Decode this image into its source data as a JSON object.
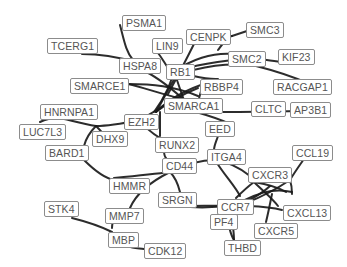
{
  "diagram": {
    "type": "protein-interaction-network",
    "background": "#ffffff",
    "edge_color": "#1a1a1a",
    "node_border_color": "#8c8c8c",
    "node_text_color": "#555555",
    "nodes": [
      {
        "id": "PSMA1",
        "label": "PSMA1",
        "x": 122,
        "y": 15
      },
      {
        "id": "TCERG1",
        "label": "TCERG1",
        "x": 47,
        "y": 38
      },
      {
        "id": "LIN9",
        "label": "LIN9",
        "x": 152,
        "y": 38
      },
      {
        "id": "CENPK",
        "label": "CENPK",
        "x": 186,
        "y": 29
      },
      {
        "id": "SMC3",
        "label": "SMC3",
        "x": 246,
        "y": 22
      },
      {
        "id": "HSPA8",
        "label": "HSPA8",
        "x": 119,
        "y": 58
      },
      {
        "id": "SMC2",
        "label": "SMC2",
        "x": 228,
        "y": 51
      },
      {
        "id": "KIF23",
        "label": "KIF23",
        "x": 278,
        "y": 49
      },
      {
        "id": "RB1",
        "label": "RB1",
        "x": 166,
        "y": 64
      },
      {
        "id": "SMARCE1",
        "label": "SMARCE1",
        "x": 70,
        "y": 78
      },
      {
        "id": "RBBP4",
        "label": "RBBP4",
        "x": 200,
        "y": 79
      },
      {
        "id": "RACGAP1",
        "label": "RACGAP1",
        "x": 273,
        "y": 79
      },
      {
        "id": "SMARCA1",
        "label": "SMARCA1",
        "x": 164,
        "y": 98
      },
      {
        "id": "HNRNPA1",
        "label": "HNRNPA1",
        "x": 40,
        "y": 104
      },
      {
        "id": "EZH2",
        "label": "EZH2",
        "x": 124,
        "y": 114
      },
      {
        "id": "CLTC",
        "label": "CLTC",
        "x": 251,
        "y": 101
      },
      {
        "id": "AP3B1",
        "label": "AP3B1",
        "x": 290,
        "y": 102
      },
      {
        "id": "LUC7L3",
        "label": "LUC7L3",
        "x": 19,
        "y": 124
      },
      {
        "id": "DHX9",
        "label": "DHX9",
        "x": 92,
        "y": 131
      },
      {
        "id": "EED",
        "label": "EED",
        "x": 205,
        "y": 121
      },
      {
        "id": "BARD1",
        "label": "BARD1",
        "x": 45,
        "y": 145
      },
      {
        "id": "RUNX2",
        "label": "RUNX2",
        "x": 155,
        "y": 137
      },
      {
        "id": "CD44",
        "label": "CD44",
        "x": 162,
        "y": 158
      },
      {
        "id": "ITGA4",
        "label": "ITGA4",
        "x": 207,
        "y": 149
      },
      {
        "id": "CCL19",
        "label": "CCL19",
        "x": 292,
        "y": 145
      },
      {
        "id": "CXCR3",
        "label": "CXCR3",
        "x": 248,
        "y": 167
      },
      {
        "id": "HMMR",
        "label": "HMMR",
        "x": 109,
        "y": 178
      },
      {
        "id": "SRGN",
        "label": "SRGN",
        "x": 158,
        "y": 192
      },
      {
        "id": "CCR7",
        "label": "CCR7",
        "x": 217,
        "y": 199
      },
      {
        "id": "CXCL13",
        "label": "CXCL13",
        "x": 283,
        "y": 205
      },
      {
        "id": "PF4",
        "label": "PF4",
        "x": 210,
        "y": 214
      },
      {
        "id": "CXCR5",
        "label": "CXCR5",
        "x": 254,
        "y": 223
      },
      {
        "id": "STK4",
        "label": "STK4",
        "x": 44,
        "y": 201
      },
      {
        "id": "MMP7",
        "label": "MMP7",
        "x": 105,
        "y": 208
      },
      {
        "id": "MBP",
        "label": "MBP",
        "x": 108,
        "y": 232
      },
      {
        "id": "THBD",
        "label": "THBD",
        "x": 224,
        "y": 240
      },
      {
        "id": "CDK12",
        "label": "CDK12",
        "x": 144,
        "y": 243
      }
    ],
    "edges": [
      {
        "d": "M 120 25 C 124 40, 126 52, 133 60"
      },
      {
        "d": "M 82 54 C 100 54, 118 57, 135 62"
      },
      {
        "d": "M 158 53 C 162 58, 164 62, 168 68"
      },
      {
        "d": "M 140 69 C 152 74, 164 82, 182 98"
      },
      {
        "d": "M 128 84 C 152 84, 174 86, 198 96"
      },
      {
        "d": "M 128 84 C 146 88, 166 96, 188 100"
      },
      {
        "d": "M 174 72 C 178 82, 180 90, 184 100"
      },
      {
        "d": "M 174 72 C 170 84, 166 96, 154 112"
      },
      {
        "d": "M 174 72 C 196 76, 206 80, 218 79"
      },
      {
        "d": "M 174 72 C 190 60, 212 52, 234 54"
      },
      {
        "d": "M 174 72 C 196 64, 230 60, 254 58 C 270 60, 282 64, 295 60"
      },
      {
        "d": "M 176 76 C 200 66, 230 62, 256 66 C 280 72, 296 78, 310 84"
      },
      {
        "d": "M 168 94 C 180 72, 188 56, 196 40"
      },
      {
        "d": "M 218 50 C 224 42, 228 36, 232 36"
      },
      {
        "d": "M 232 36 C 238 34, 244 32, 250 30"
      },
      {
        "d": "M 156 112 C 166 104, 178 96, 198 88"
      },
      {
        "d": "M 156 112 C 170 98, 190 88, 210 82"
      },
      {
        "d": "M 156 112 C 164 98, 170 86, 176 76"
      },
      {
        "d": "M 196 112 C 198 102, 200 94, 202 88"
      },
      {
        "d": "M 196 112 C 210 116, 222 120, 230 124"
      },
      {
        "d": "M 196 112 C 230 112, 290 112, 320 110"
      },
      {
        "d": "M 140 120 C 150 114, 164 106, 172 100"
      },
      {
        "d": "M 140 120 C 144 126, 150 132, 160 138"
      },
      {
        "d": "M 140 120 C 120 124, 104 126, 96 126"
      },
      {
        "d": "M 96 126 C 80 124, 64 118, 58 118 C 50 118, 44 120, 40 122"
      },
      {
        "d": "M 96 126 C 100 130, 104 134, 106 138"
      },
      {
        "d": "M 96 126 C 90 132, 86 138, 84 146"
      },
      {
        "d": "M 160 112 C 160 122, 160 130, 160 136"
      },
      {
        "d": "M 164 150 C 164 154, 164 156, 166 158"
      },
      {
        "d": "M 218 136 C 216 142, 214 146, 214 150"
      },
      {
        "d": "M 84 160 C 94 170, 104 178, 114 180"
      },
      {
        "d": "M 114 178 C 134 176, 154 174, 170 172"
      },
      {
        "d": "M 170 172 C 186 164, 200 160, 215 160"
      },
      {
        "d": "M 215 160 C 230 162, 240 168, 250 176"
      },
      {
        "d": "M 215 160 C 225 176, 235 186, 240 196"
      },
      {
        "d": "M 170 172 C 176 178, 178 184, 180 192"
      },
      {
        "d": "M 170 172 C 150 182, 136 194, 130 208"
      },
      {
        "d": "M 178 206 C 196 208, 214 208, 230 205"
      },
      {
        "d": "M 180 206 C 220 206, 260 204, 282 210"
      },
      {
        "d": "M 254 182 C 266 184, 276 186, 286 192"
      },
      {
        "d": "M 254 182 C 264 192, 272 198, 278 206"
      },
      {
        "d": "M 254 182 C 246 188, 240 194, 236 198"
      },
      {
        "d": "M 254 182 C 264 178, 278 176, 290 180"
      },
      {
        "d": "M 290 180 C 296 170, 302 162, 306 156"
      },
      {
        "d": "M 290 180 C 278 188, 264 196, 248 202"
      },
      {
        "d": "M 290 180 C 292 186, 292 190, 292 194"
      },
      {
        "d": "M 270 186 C 262 194, 250 200, 240 205"
      },
      {
        "d": "M 245 200 C 260 192, 276 188, 292 192"
      },
      {
        "d": "M 272 194 C 270 204, 268 214, 266 222"
      },
      {
        "d": "M 230 205 C 232 218, 234 232, 234 240"
      },
      {
        "d": "M 226 210 C 228 224, 230 234, 234 240"
      },
      {
        "d": "M 72 218 C 88 222, 100 226, 112 232"
      },
      {
        "d": "M 112 228 C 112 224, 114 218, 116 214"
      },
      {
        "d": "M 128 246 C 132 248, 136 248, 144 249"
      }
    ]
  }
}
